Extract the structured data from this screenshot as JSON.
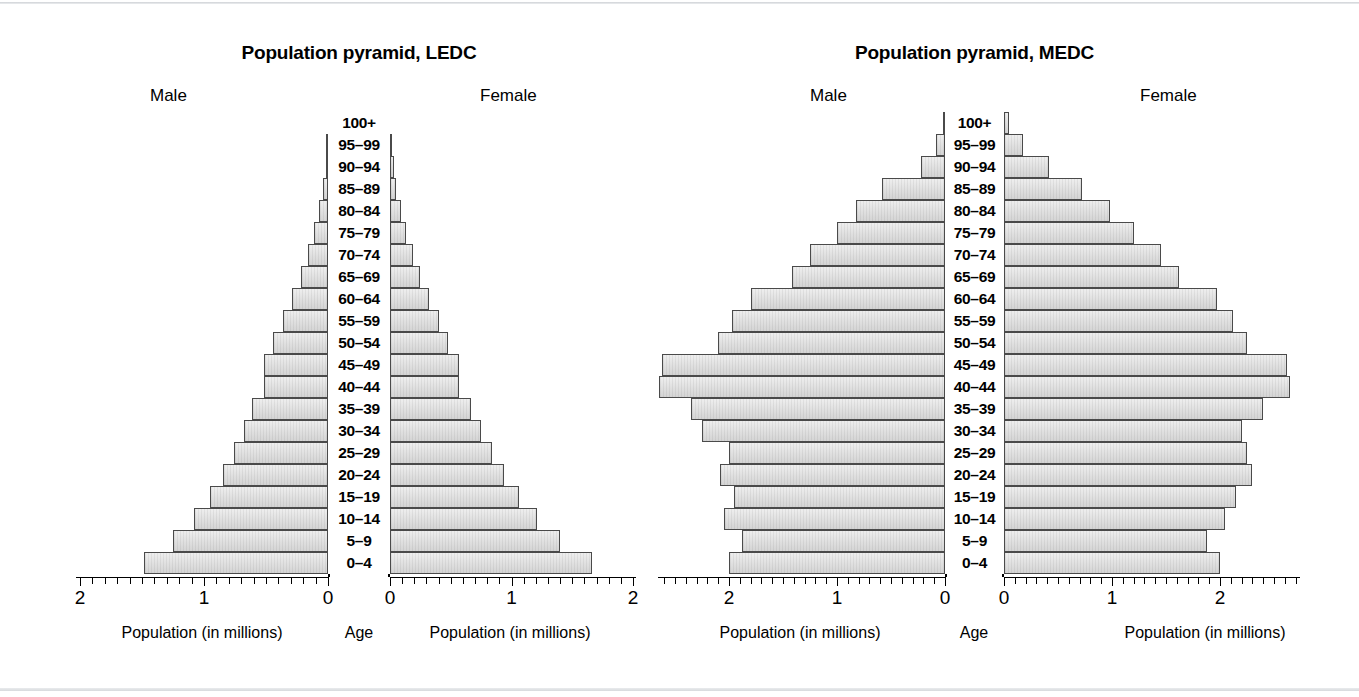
{
  "figure": {
    "background": "#ffffff",
    "bar_fill": "#e4e4e4",
    "bar_stroke": "#4a4a4a",
    "axis_color": "#000000"
  },
  "charts": [
    {
      "id": "ledc",
      "title": "Population pyramid, LEDC",
      "left_header": "Male",
      "right_header": "Female",
      "center_axis_caption": "Age",
      "left_caption": "Population (in millions)",
      "right_caption": "Population (in millions)",
      "tick_labels_left": [
        "2",
        "1",
        "0"
      ],
      "tick_labels_right": [
        "0",
        "1",
        "2"
      ]
    },
    {
      "id": "medc",
      "title": "Population pyramid, MEDC",
      "left_header": "Male",
      "right_header": "Female",
      "center_axis_caption": "Age",
      "left_caption": "Population (in millions)",
      "right_caption": "Population (in millions)",
      "tick_labels_left": [
        "2",
        "1",
        "0"
      ],
      "tick_labels_right": [
        "0",
        "1",
        "2"
      ]
    }
  ],
  "age_groups": [
    "100+",
    "95–99",
    "90–94",
    "85–89",
    "80–84",
    "75–79",
    "70–74",
    "65–69",
    "60–64",
    "55–59",
    "50–54",
    "45–49",
    "40–44",
    "35–39",
    "30–34",
    "25–29",
    "20–24",
    "15–19",
    "10–14",
    "5–9",
    "0–4"
  ],
  "chart_data": [
    {
      "type": "bar",
      "subtype": "population-pyramid",
      "title": "Population pyramid, LEDC",
      "xlabel": "Population (in millions)",
      "ylabel": "Age",
      "orientation": "horizontal-diverging",
      "categories": [
        "100+",
        "95–99",
        "90–94",
        "85–89",
        "80–84",
        "75–79",
        "70–74",
        "65–69",
        "60–64",
        "55–59",
        "50–54",
        "45–49",
        "40–44",
        "35–39",
        "30–34",
        "25–29",
        "20–24",
        "15–19",
        "10–14",
        "5–9",
        "0–4"
      ],
      "series": [
        {
          "name": "Male",
          "side": "left",
          "values": [
            0.0,
            0.01,
            0.02,
            0.04,
            0.07,
            0.11,
            0.16,
            0.22,
            0.29,
            0.36,
            0.44,
            0.52,
            0.52,
            0.61,
            0.68,
            0.76,
            0.85,
            0.95,
            1.08,
            1.25,
            1.48
          ]
        },
        {
          "name": "Female",
          "side": "right",
          "values": [
            0.0,
            0.01,
            0.03,
            0.05,
            0.09,
            0.13,
            0.19,
            0.25,
            0.32,
            0.4,
            0.48,
            0.57,
            0.57,
            0.67,
            0.75,
            0.84,
            0.94,
            1.06,
            1.21,
            1.4,
            1.66
          ]
        }
      ],
      "xlim_left": [
        2,
        0
      ],
      "xlim_right": [
        0,
        2
      ],
      "xticks_left": [
        2,
        1,
        0
      ],
      "xticks_right": [
        0,
        1,
        2
      ],
      "minor_tick_interval": 0.1,
      "grid": false,
      "legend": "none"
    },
    {
      "type": "bar",
      "subtype": "population-pyramid",
      "title": "Population pyramid, MEDC",
      "xlabel": "Population (in millions)",
      "ylabel": "Age",
      "orientation": "horizontal-diverging",
      "categories": [
        "100+",
        "95–99",
        "90–94",
        "85–89",
        "80–84",
        "75–79",
        "70–74",
        "65–69",
        "60–64",
        "55–59",
        "50–54",
        "45–49",
        "40–44",
        "35–39",
        "30–34",
        "25–29",
        "20–24",
        "15–19",
        "10–14",
        "5–9",
        "0–4"
      ],
      "series": [
        {
          "name": "Male",
          "side": "left",
          "values": [
            0.02,
            0.08,
            0.22,
            0.58,
            0.82,
            1.0,
            1.25,
            1.42,
            1.8,
            1.97,
            2.1,
            2.62,
            2.65,
            2.35,
            2.25,
            2.0,
            2.08,
            1.95,
            2.05,
            1.88,
            2.0
          ]
        },
        {
          "name": "Female",
          "side": "right",
          "values": [
            0.05,
            0.18,
            0.42,
            0.72,
            0.98,
            1.2,
            1.45,
            1.62,
            1.97,
            2.12,
            2.25,
            2.62,
            2.65,
            2.4,
            2.2,
            2.25,
            2.3,
            2.15,
            2.05,
            1.88,
            2.0
          ]
        }
      ],
      "xlim_left": [
        2.65,
        0
      ],
      "xlim_right": [
        0,
        2.75
      ],
      "xticks_left": [
        2,
        1,
        0
      ],
      "xticks_right": [
        0,
        1,
        2
      ],
      "minor_tick_interval": 0.1,
      "grid": false,
      "legend": "none"
    }
  ]
}
